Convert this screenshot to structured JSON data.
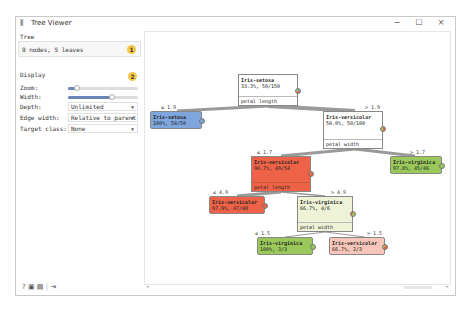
{
  "window": {
    "title": "Tree Viewer",
    "title_icon": "tree-icon",
    "controls": {
      "minimize": "−",
      "maximize": "☐",
      "close": "×"
    }
  },
  "sidebar": {
    "tree_section": {
      "label": "Tree",
      "info": "9 nodes, 5 leaves",
      "badge": "1"
    },
    "display_section": {
      "label": "Display",
      "badge": "2",
      "zoom_label": "Zoom:",
      "zoom_value_pct": 12,
      "width_label": "Width:",
      "width_value_pct": 62,
      "depth_label": "Depth:",
      "depth_value": "Unlimited",
      "edge_width_label": "Edge width:",
      "edge_width_value": "Relative to parent",
      "target_class_label": "Target class:",
      "target_class_value": "None"
    },
    "footer_icons": [
      "help-icon",
      "save-image-icon",
      "report-icon",
      "output-icon"
    ]
  },
  "tree": {
    "colors": {
      "setosa": "#7ea5dc",
      "versicolor": "#ee6347",
      "versicolor_light": "#f7c5b9",
      "virginica": "#9ac85b",
      "virginica_light": "#eef3d8",
      "neutral": "#ffffff"
    },
    "nodes": [
      {
        "id": "root",
        "cls": "Iris-setosa",
        "stat": "33.3%, 50/150",
        "attr": "petal length"
      },
      {
        "id": "n1",
        "cls": "Iris-setosa",
        "stat": "100%, 50/50",
        "edge": "≤ 1.9"
      },
      {
        "id": "n2",
        "cls": "Iris-versicolor",
        "stat": "50.0%, 50/100",
        "attr": "petal width",
        "edge": "> 1.9"
      },
      {
        "id": "n3",
        "cls": "Iris-versicolor",
        "stat": "90.7%, 49/54",
        "attr": "petal length",
        "edge": "≤ 1.7"
      },
      {
        "id": "n4",
        "cls": "Iris-virginica",
        "stat": "97.8%, 45/46",
        "edge": "> 1.7"
      },
      {
        "id": "n5",
        "cls": "Iris-versicolor",
        "stat": "97.9%, 47/48",
        "edge": "≤ 4.9"
      },
      {
        "id": "n6",
        "cls": "Iris-virginica",
        "stat": "66.7%, 4/6",
        "attr": "petal width",
        "edge": "> 4.9"
      },
      {
        "id": "n7",
        "cls": "Iris-virginica",
        "stat": "100%, 3/3",
        "edge": "≤ 1.5"
      },
      {
        "id": "n8",
        "cls": "Iris-versicolor",
        "stat": "66.7%, 2/3",
        "edge": "> 1.5"
      }
    ]
  }
}
